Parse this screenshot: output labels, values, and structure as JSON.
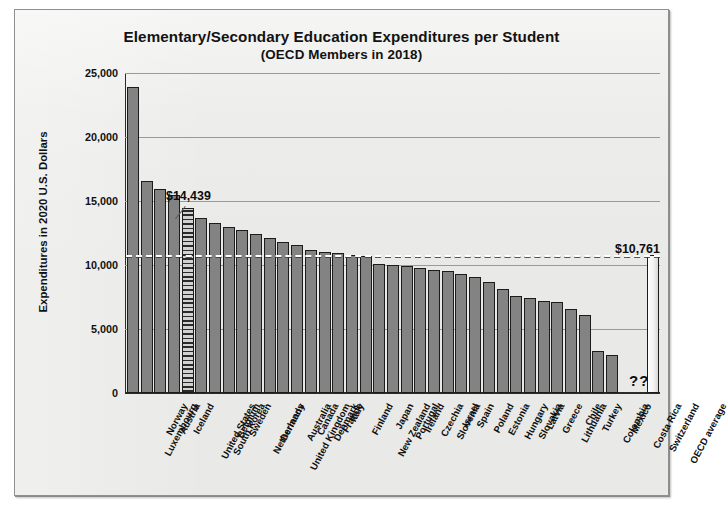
{
  "chart_data": {
    "type": "bar",
    "title": "Elementary/Secondary Education Expenditures per Student",
    "subtitle": "(OECD Members in 2018)",
    "xlabel": "",
    "ylabel": "Expenditures in 2020 U.S. Dollars",
    "ylim": [
      0,
      25000
    ],
    "yticks": [
      0,
      5000,
      10000,
      15000,
      20000,
      25000
    ],
    "ytick_labels": [
      "0",
      "5,000",
      "10,000",
      "15,000",
      "20,000",
      "25,000"
    ],
    "grid": "horizontal",
    "legend": "none",
    "categories": [
      "Luxembourg",
      "Norway",
      "Austria",
      "Iceland",
      "United States",
      "South Korea",
      "Belgium",
      "Sweden",
      "Netherlands",
      "Germany",
      "United Kingdom",
      "Australia",
      "Canada",
      "Denmark",
      "France",
      "Italy",
      "Finland",
      "New Zealand",
      "Japan",
      "Portugal",
      "Ireland",
      "Czechia",
      "Slovenia",
      "Israel",
      "Spain",
      "Poland",
      "Estonia",
      "Hungary",
      "Slovakia",
      "Latvia",
      "Greece",
      "Lithuania",
      "Chile",
      "Turkey",
      "Colombia",
      "Mexico",
      "Costa Rica",
      "Switzerland",
      "OECD average"
    ],
    "values": [
      23900,
      16600,
      15900,
      15500,
      14439,
      13700,
      13300,
      13000,
      12700,
      12400,
      12100,
      11800,
      11600,
      11200,
      11000,
      10900,
      10800,
      10700,
      10100,
      10000,
      9900,
      9800,
      9600,
      9500,
      9300,
      9100,
      8700,
      8100,
      7600,
      7400,
      7200,
      7100,
      6600,
      6100,
      3300,
      3000,
      null,
      null,
      10761
    ],
    "annotations": [
      {
        "id": "us-value",
        "text": "$14,439",
        "refers_to": "United States"
      },
      {
        "id": "oecd-average-value",
        "text": "$10,761",
        "refers_to": "OECD average"
      },
      {
        "id": "missing-data",
        "text": "??",
        "refers_to": "Costa Rica / Switzerland"
      }
    ],
    "reference_line": {
      "label": "OECD average",
      "value": 10761,
      "style": "dashed"
    },
    "series_styles": {
      "default_bar": "solid-gray",
      "highlight_bar": "United States (hatched)",
      "average_bar": "OECD average (light)"
    },
    "colors": {
      "bar": "#838383",
      "bar_outline": "#1c1c1c",
      "panel_background": "#e9e9e7",
      "gridline": "#9a9a9a",
      "text": "#111111",
      "average_bar": "#f2f2f2"
    }
  },
  "source_note": ""
}
